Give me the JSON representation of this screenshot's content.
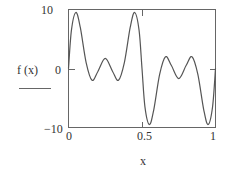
{
  "chart_data": {
    "type": "line",
    "title": "",
    "xlabel": "x",
    "ylabel": "f (x)",
    "xlim": [
      0,
      1
    ],
    "ylim": [
      -10,
      10
    ],
    "xticks": [
      "0",
      "0.5",
      "1"
    ],
    "yticks": [
      "10",
      "0",
      "-10"
    ],
    "grid": false,
    "legend": null,
    "series": [
      {
        "name": "f (x)",
        "x": [
          0,
          0.02,
          0.05,
          0.08,
          0.12,
          0.16,
          0.2,
          0.25,
          0.3,
          0.34,
          0.38,
          0.42,
          0.45,
          0.48,
          0.5,
          0.52,
          0.55,
          0.58,
          0.62,
          0.66,
          0.7,
          0.75,
          0.8,
          0.84,
          0.88,
          0.92,
          0.95,
          0.98,
          1.0
        ],
        "y": [
          0,
          6.5,
          9.5,
          7,
          1,
          -2,
          -0.5,
          1.7,
          -0.5,
          -2,
          1,
          7,
          9.5,
          6.5,
          0,
          -6.5,
          -9.5,
          -7,
          -1,
          2,
          0.5,
          -1.7,
          0.5,
          2,
          -1,
          -7,
          -9.5,
          -6.5,
          0
        ]
      }
    ]
  },
  "labels": {
    "ytick_top": "10",
    "ytick_mid": "0",
    "ytick_bottom": "−10",
    "xtick_left": "0",
    "xtick_mid": "0.5",
    "xtick_right": "1",
    "xlabel": "x",
    "ylabel": "f (x)"
  },
  "colors": {
    "axis": "#555555",
    "curve": "#555555"
  }
}
